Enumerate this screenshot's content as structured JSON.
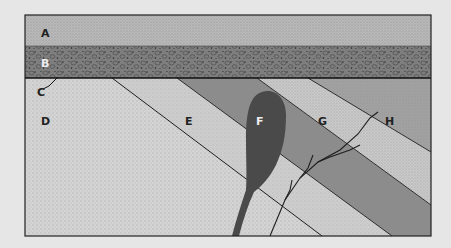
{
  "labels": {
    "A": "A",
    "B": "B",
    "C": "C",
    "D": "D",
    "E": "E",
    "F": "F",
    "G": "G",
    "H": "H"
  },
  "units": [
    {
      "id": "A",
      "description": "top horizontal layer, fine speckled"
    },
    {
      "id": "B",
      "description": "horizontal conglomerate layer, pebbles"
    },
    {
      "id": "C",
      "description": "unconformity surface line"
    },
    {
      "id": "D",
      "description": "light stippled tilted rock, lower left"
    },
    {
      "id": "E",
      "description": "light tilted band"
    },
    {
      "id": "F",
      "description": "dark intrusion with feeder dike"
    },
    {
      "id": "G",
      "description": "light stippled tilted band"
    },
    {
      "id": "H",
      "description": "medium gray tilted layer, upper right"
    }
  ],
  "colors": {
    "background": "#e6e6e6",
    "layer_a": "#b9b9b9",
    "layer_b": "#7e7e7e",
    "layer_d": "#d4d4d4",
    "layer_e": "#cdcdcd",
    "dark_band": "#8c8c8c",
    "layer_g": "#c9c9c9",
    "layer_h": "#a2a2a2",
    "intrusion_f": "#4a4a4a",
    "lines": "#1e1e1e"
  }
}
